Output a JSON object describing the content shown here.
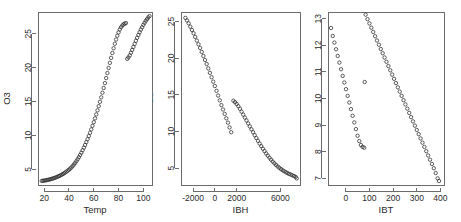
{
  "figure": {
    "background": "#ffffff",
    "foreground": "#2b2b2b",
    "axis_color": "#6b6b6b",
    "marker": "open-circle",
    "marker_color": "#2a2a2a"
  },
  "chart_data": [
    {
      "type": "scatter",
      "title": "",
      "xlabel": "Temp",
      "ylabel": "O3",
      "xlim": [
        15,
        107
      ],
      "ylim": [
        2.7,
        28.2
      ],
      "xticks": [
        20,
        40,
        60,
        80,
        100
      ],
      "yticks": [
        5,
        10,
        15,
        20,
        25
      ],
      "grid": false,
      "legend": "none",
      "series": [
        {
          "name": "branch-lower",
          "x": [
            18,
            19,
            20,
            21,
            22,
            23,
            24,
            25,
            26,
            27,
            28,
            29,
            30,
            31,
            32,
            33,
            34,
            35,
            36,
            37,
            38,
            39,
            40,
            41,
            42,
            43,
            44,
            45,
            46,
            47,
            48,
            49,
            50,
            51,
            52,
            53,
            54,
            55,
            56,
            57,
            58,
            59,
            60,
            61,
            62,
            63,
            64,
            65,
            66,
            67,
            68,
            69,
            70,
            71,
            72,
            73,
            74,
            75,
            76,
            77,
            78,
            79,
            80,
            81,
            82,
            83,
            84,
            85,
            86
          ],
          "y": [
            3.3,
            3.32,
            3.35,
            3.38,
            3.42,
            3.46,
            3.5,
            3.55,
            3.6,
            3.66,
            3.72,
            3.79,
            3.86,
            3.94,
            4.02,
            4.11,
            4.21,
            4.31,
            4.42,
            4.54,
            4.67,
            4.81,
            4.96,
            5.12,
            5.3,
            5.5,
            5.72,
            5.96,
            6.22,
            6.5,
            6.8,
            7.12,
            7.46,
            7.82,
            8.2,
            8.6,
            9.02,
            9.46,
            9.92,
            10.4,
            10.9,
            11.42,
            11.96,
            12.52,
            13.1,
            13.7,
            14.32,
            14.96,
            15.62,
            16.3,
            17.0,
            17.72,
            18.46,
            19.2,
            19.95,
            20.7,
            21.44,
            22.16,
            22.86,
            23.52,
            24.14,
            24.7,
            25.2,
            25.62,
            25.95,
            26.2,
            26.38,
            26.5,
            26.56
          ]
        },
        {
          "name": "branch-upper",
          "x": [
            87,
            88,
            89,
            90,
            91,
            92,
            93,
            94,
            95,
            96,
            97,
            98,
            99,
            100,
            101,
            102,
            103,
            104,
            105
          ],
          "y": [
            21.3,
            21.5,
            21.8,
            22.2,
            22.6,
            23.05,
            23.5,
            23.95,
            24.4,
            24.82,
            25.22,
            25.6,
            25.95,
            26.3,
            26.6,
            26.9,
            27.15,
            27.4,
            27.6
          ]
        }
      ]
    },
    {
      "type": "scatter",
      "title": "",
      "xlabel": "IBH",
      "ylabel": "O3",
      "xlim": [
        -3100,
        7800
      ],
      "ylim": [
        2.7,
        26.3
      ],
      "xticks": [
        -2000,
        0,
        2000,
        6000
      ],
      "yticks": [
        5,
        10,
        15,
        20,
        25
      ],
      "grid": false,
      "legend": "none",
      "series": [
        {
          "name": "branch-upper-left",
          "x": [
            -2700,
            -2550,
            -2400,
            -2250,
            -2100,
            -1950,
            -1800,
            -1650,
            -1500,
            -1350,
            -1200,
            -1050,
            -900,
            -750,
            -600,
            -450,
            -300,
            -150,
            0,
            150,
            300,
            450,
            600,
            750,
            900,
            1050,
            1200,
            1350,
            1500
          ],
          "y": [
            25.5,
            25.15,
            24.75,
            24.3,
            23.85,
            23.4,
            22.9,
            22.4,
            21.9,
            21.4,
            20.85,
            20.3,
            19.75,
            19.2,
            18.6,
            18.0,
            17.4,
            16.8,
            16.2,
            15.55,
            14.9,
            14.25,
            13.6,
            13.0,
            12.4,
            11.8,
            11.2,
            10.55,
            9.9
          ]
        },
        {
          "name": "branch-lower-right",
          "x": [
            1700,
            1850,
            2000,
            2150,
            2300,
            2450,
            2600,
            2750,
            2900,
            3050,
            3200,
            3350,
            3500,
            3650,
            3800,
            3950,
            4100,
            4250,
            4400,
            4550,
            4700,
            4850,
            5000,
            5150,
            5300,
            5450,
            5600,
            5750,
            5900,
            6050,
            6200,
            6350,
            6500,
            6650,
            6800,
            6950,
            7100,
            7250,
            7400,
            7500
          ],
          "y": [
            14.2,
            14.0,
            13.75,
            13.45,
            13.1,
            12.7,
            12.3,
            11.9,
            11.5,
            11.1,
            10.7,
            10.3,
            9.9,
            9.5,
            9.1,
            8.72,
            8.35,
            8.0,
            7.65,
            7.32,
            7.0,
            6.7,
            6.42,
            6.15,
            5.9,
            5.66,
            5.44,
            5.24,
            5.05,
            4.88,
            4.72,
            4.58,
            4.45,
            4.33,
            4.22,
            4.12,
            4.03,
            3.92,
            3.8,
            3.6
          ]
        }
      ]
    },
    {
      "type": "scatter",
      "title": "",
      "xlabel": "IBT",
      "ylabel": "O3",
      "xlim": [
        -75,
        415
      ],
      "ylim": [
        6.75,
        13.25
      ],
      "xticks": [
        0,
        100,
        200,
        300,
        400
      ],
      "yticks": [
        7,
        8,
        9,
        10,
        11,
        12,
        13
      ],
      "grid": false,
      "legend": "none",
      "series": [
        {
          "name": "branch-left",
          "x": [
            -62,
            -55,
            -48,
            -41,
            -34,
            -27,
            -20,
            -13,
            -6,
            1,
            8,
            15,
            22,
            29,
            36,
            43,
            50,
            57,
            64,
            71,
            78
          ],
          "y": [
            12.65,
            12.35,
            12.1,
            11.85,
            11.6,
            11.35,
            11.1,
            10.85,
            10.6,
            10.35,
            10.1,
            9.85,
            9.6,
            9.35,
            9.1,
            8.85,
            8.6,
            8.4,
            8.25,
            8.18,
            8.15
          ]
        },
        {
          "name": "branch-right",
          "x": [
            84,
            92,
            100,
            108,
            116,
            124,
            132,
            140,
            148,
            156,
            164,
            172,
            180,
            188,
            196,
            204,
            212,
            220,
            228,
            236,
            244,
            252,
            260,
            268,
            276,
            284,
            292,
            300,
            308,
            316,
            324,
            332,
            340,
            348,
            356,
            364,
            372,
            380,
            388,
            394
          ],
          "y": [
            13.15,
            12.98,
            12.82,
            12.66,
            12.5,
            12.34,
            12.18,
            12.02,
            11.86,
            11.7,
            11.54,
            11.38,
            11.22,
            11.06,
            10.9,
            10.74,
            10.58,
            10.42,
            10.26,
            10.1,
            9.94,
            9.78,
            9.62,
            9.46,
            9.3,
            9.14,
            8.98,
            8.82,
            8.66,
            8.5,
            8.34,
            8.18,
            8.02,
            7.86,
            7.7,
            7.54,
            7.38,
            7.2,
            7.0,
            6.9
          ]
        },
        {
          "name": "outlier",
          "x": [
            80
          ],
          "y": [
            10.62
          ]
        }
      ]
    }
  ]
}
